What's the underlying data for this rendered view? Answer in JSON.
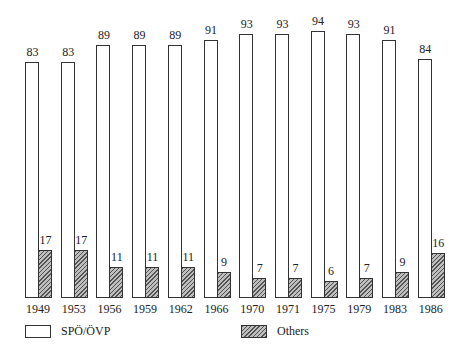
{
  "chart_data": {
    "type": "bar",
    "title": "",
    "xlabel": "",
    "ylabel": "",
    "grid": false,
    "legend_position": "bottom",
    "categories": [
      "1949",
      "1953",
      "1956",
      "1959",
      "1962",
      "1966",
      "1970",
      "1971",
      "1975",
      "1979",
      "1983",
      "1986"
    ],
    "series": [
      {
        "name": "SPÖ/ÖVP",
        "style": "white",
        "values": [
          83,
          83,
          89,
          89,
          89,
          91,
          93,
          93,
          94,
          93,
          91,
          84
        ]
      },
      {
        "name": "Others",
        "style": "hatched",
        "values": [
          17,
          17,
          11,
          11,
          11,
          9,
          7,
          7,
          6,
          7,
          9,
          16
        ]
      }
    ],
    "ylim": [
      0,
      100
    ]
  },
  "legend": {
    "items": [
      {
        "label": "SPÖ/ÖVP",
        "swatch": "white"
      },
      {
        "label": "Others",
        "swatch": "hatched"
      }
    ]
  },
  "colors": {
    "outline": "#333333",
    "white_bar": "#ffffff",
    "hatch_bar": "#bdbdbd"
  }
}
